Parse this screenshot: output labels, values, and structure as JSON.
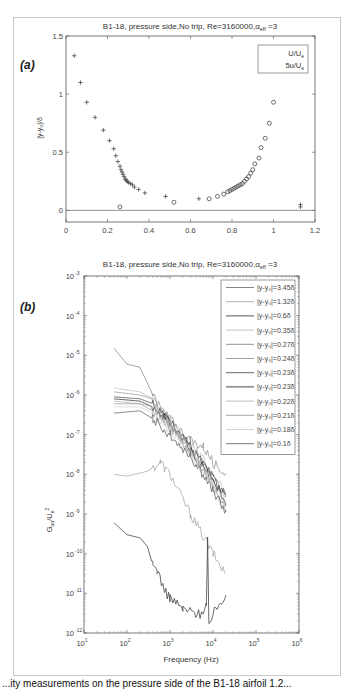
{
  "figure": {
    "caption_partial": "...ity measurements on the pressure side of the B1-18 airfoil 1.2..."
  },
  "chart_data": [
    {
      "panel": "(a)",
      "type": "scatter",
      "title": "B1-18, pressure side,No trip, Re=3160000,α_eff =3",
      "title_parts": {
        "main": "B1-18, pressure side,No trip, Re=3160000,",
        "alpha": "α",
        "sub": "eff",
        "tail": " =3"
      },
      "xlabel": "",
      "ylabel": "|y-y₀|/δ",
      "xlim": [
        0,
        1.2
      ],
      "ylim": [
        -0.1,
        1.5
      ],
      "xticks": [
        0,
        0.2,
        0.4,
        0.6,
        0.8,
        1,
        1.2
      ],
      "xtick_labels": [
        "0",
        "0.2",
        "0.4",
        "0.6",
        "0.8",
        "1",
        "1.2"
      ],
      "yticks": [
        0,
        0.5,
        1,
        1.5
      ],
      "ytick_labels": [
        "0",
        "0.5",
        "1",
        "1.5"
      ],
      "hline_y": 0,
      "legend": {
        "position": "upper right",
        "entries": [
          "U/U_e",
          "5u/U_e"
        ]
      },
      "series": [
        {
          "name": "U/U_e",
          "marker": "circle",
          "x": [
            0.26,
            0.52,
            0.69,
            0.73,
            0.76,
            0.78,
            0.79,
            0.8,
            0.81,
            0.82,
            0.83,
            0.84,
            0.85,
            0.86,
            0.87,
            0.88,
            0.89,
            0.9,
            0.91,
            0.93,
            0.94,
            0.96,
            0.98,
            1.0
          ],
          "y": [
            0.03,
            0.07,
            0.1,
            0.12,
            0.14,
            0.16,
            0.17,
            0.18,
            0.19,
            0.2,
            0.21,
            0.22,
            0.23,
            0.25,
            0.27,
            0.29,
            0.32,
            0.35,
            0.4,
            0.45,
            0.54,
            0.62,
            0.75,
            0.93,
            1.1
          ]
        },
        {
          "name": "5u/U_e",
          "marker": "plus",
          "x": [
            0.04,
            0.07,
            0.1,
            0.14,
            0.18,
            0.21,
            0.23,
            0.24,
            0.25,
            0.26,
            0.265,
            0.27,
            0.275,
            0.28,
            0.285,
            0.29,
            0.295,
            0.3,
            0.31,
            0.32,
            0.33,
            0.35,
            0.38,
            0.48,
            0.64,
            1.13,
            1.13
          ],
          "y": [
            1.33,
            1.1,
            0.93,
            0.8,
            0.69,
            0.6,
            0.53,
            0.47,
            0.42,
            0.38,
            0.35,
            0.33,
            0.31,
            0.29,
            0.27,
            0.26,
            0.25,
            0.24,
            0.23,
            0.22,
            0.2,
            0.18,
            0.15,
            0.12,
            0.1,
            0.05,
            0.03
          ]
        }
      ]
    },
    {
      "panel": "(b)",
      "type": "line",
      "scale": "loglog",
      "title": "B1-18, pressure side,No trip, Re=3160000,α_eff =3",
      "title_parts": {
        "main": "B1-18, pressure side,No trip, Re=3160000,",
        "alpha": "α",
        "sub": "eff",
        "tail": " =3"
      },
      "xlabel": "Frequency (Hz)",
      "ylabel": "G_uu/U_e^2",
      "xlim": [
        10,
        1000000
      ],
      "ylim": [
        1e-12,
        0.001
      ],
      "xtick_exponents": [
        1,
        2,
        3,
        4,
        5,
        6
      ],
      "ytick_exponents": [
        -3,
        -4,
        -5,
        -6,
        -7,
        -8,
        -9,
        -10,
        -11,
        -12
      ],
      "legend": {
        "position": "upper right",
        "entries": [
          "|y-y₀|=3.45δ",
          "|y-y₀|=1.32δ",
          "|y-y₀|=0.6δ",
          "|y-y₀|=0.35δ",
          "|y-y₀|=0.27δ",
          "|y-y₀|=0.24δ",
          "|y-y₀|=0.23δ",
          "|y-y₀|=0.23δ",
          "|y-y₀|=0.22δ",
          "|y-y₀|=0.21δ",
          "|y-y₀|=0.18δ",
          "|y-y₀|=0.1δ"
        ]
      },
      "series": [
        {
          "name": "|y-y₀|=3.45δ",
          "color": "#777777",
          "f": [
            50,
            2000,
            8000,
            20000
          ],
          "G": [
            8e-12,
            2e-11,
            5e-12,
            1e-11
          ],
          "shape": "noise_floor"
        },
        {
          "name": "|y-y₀|=1.32δ",
          "color": "#aaaaaa",
          "f": [
            50,
            100,
            300,
            600,
            1000,
            3000,
            10000,
            20000
          ],
          "G": [
            1e-08,
            9e-09,
            1.2e-08,
            2e-08,
            1e-08,
            1e-09,
            1e-10,
            3e-11
          ]
        },
        {
          "name": "|y-y₀|=0.6δ",
          "color": "#444444",
          "f": [
            50,
            100,
            200,
            300,
            400,
            500,
            800,
            1000,
            2000,
            5000,
            7000,
            7500,
            8000,
            10000,
            20000
          ],
          "G": [
            6e-10,
            3e-10,
            2.5e-10,
            1.5e-10,
            5e-11,
            4e-11,
            1e-11,
            8e-12,
            4e-12,
            3e-12,
            5e-12,
            2e-10,
            2e-12,
            3e-12,
            1e-11
          ]
        },
        {
          "name": "|y-y₀|=0.35δ",
          "color": "#c0c0c0",
          "f": [
            50,
            200,
            400,
            1000,
            5000,
            20000
          ],
          "G": [
            1.5e-06,
            1.2e-06,
            8e-07,
            2e-07,
            3e-08,
            3e-09
          ]
        },
        {
          "name": "|y-y₀|=0.27δ",
          "color": "#888888",
          "f": [
            50,
            100,
            200,
            400,
            600,
            1000,
            3000,
            10000,
            20000
          ],
          "G": [
            1.5e-05,
            6e-06,
            5e-06,
            1e-06,
            3e-07,
            2e-07,
            5e-08,
            8e-09,
            3e-09
          ]
        },
        {
          "name": "|y-y₀|=0.24δ",
          "color": "#999999",
          "f": [
            50,
            200,
            400,
            1000,
            3000,
            6000,
            10000,
            20000
          ],
          "G": [
            1.2e-06,
            1e-06,
            8e-07,
            2.5e-07,
            7e-08,
            5e-08,
            2e-08,
            1e-08
          ]
        },
        {
          "name": "|y-y₀|=0.23δ",
          "color": "#555555",
          "f": [
            50,
            200,
            400,
            1000,
            3000,
            10000,
            20000
          ],
          "G": [
            9e-07,
            8e-07,
            6e-07,
            2e-07,
            5e-08,
            8e-09,
            3e-09
          ]
        },
        {
          "name": "|y-y₀|=0.23δ",
          "color": "#333333",
          "f": [
            50,
            200,
            400,
            1000,
            3000,
            10000,
            20000
          ],
          "G": [
            8e-07,
            7e-07,
            5e-07,
            2e-07,
            4e-08,
            7e-09,
            2e-09
          ]
        },
        {
          "name": "|y-y₀|=0.22δ",
          "color": "#b5b5b5",
          "f": [
            50,
            200,
            400,
            1000,
            3000,
            10000,
            20000
          ],
          "G": [
            7e-07,
            6e-07,
            5e-07,
            1.8e-07,
            4e-08,
            6e-09,
            2e-09
          ]
        },
        {
          "name": "|y-y₀|=0.21δ",
          "color": "#a0a0a0",
          "f": [
            50,
            200,
            400,
            1000,
            3000,
            10000,
            20000
          ],
          "G": [
            6e-07,
            6e-07,
            4e-07,
            1.5e-07,
            3.5e-08,
            5e-09,
            1.5e-09
          ]
        },
        {
          "name": "|y-y₀|=0.18δ",
          "color": "#d0d0d0",
          "f": [
            50,
            200,
            400,
            1000,
            3000,
            10000,
            20000
          ],
          "G": [
            5e-07,
            5e-07,
            3.5e-07,
            1.3e-07,
            3e-08,
            5e-09,
            1.2e-09
          ]
        },
        {
          "name": "|y-y₀|=0.1δ",
          "color": "#666666",
          "f": [
            50,
            200,
            400,
            1000,
            3000,
            10000,
            20000
          ],
          "G": [
            3.5e-07,
            4e-07,
            2.5e-07,
            1e-07,
            3e-08,
            4e-09,
            1e-09
          ]
        }
      ]
    }
  ]
}
